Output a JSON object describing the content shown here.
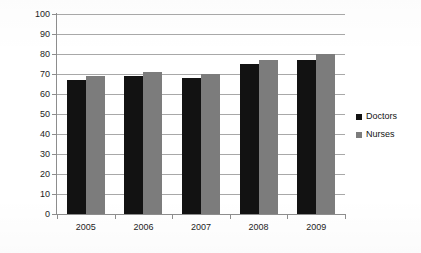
{
  "chart_data": {
    "type": "bar",
    "title": "",
    "xlabel": "",
    "ylabel": "",
    "categories": [
      "2005",
      "2006",
      "2007",
      "2008",
      "2009"
    ],
    "series": [
      {
        "name": "Doctors",
        "color": "#121212",
        "values": [
          67,
          69,
          68,
          75,
          77
        ]
      },
      {
        "name": "Nurses",
        "color": "#7c7c7c",
        "values": [
          69,
          71,
          70,
          77,
          80
        ]
      }
    ],
    "ylim": [
      0,
      100
    ],
    "ytick_step": 10,
    "ytick_labels": [
      "100",
      "90",
      "80",
      "70",
      "60",
      "50",
      "40",
      "30",
      "20",
      "10",
      "0"
    ],
    "grid": true,
    "grid_axis": "y",
    "legend_position": "right",
    "legend": [
      {
        "label": "Doctors",
        "color": "#121212",
        "marker": "square"
      },
      {
        "label": "Nurses",
        "color": "#7c7c7c",
        "marker": "square"
      }
    ]
  },
  "colors": {
    "background": "#ffffff",
    "axis": "#8d8d8d",
    "grid": "#a8a8a8",
    "text": "#1d1d1d",
    "doctors": "#121212",
    "nurses": "#7c7c7c"
  }
}
